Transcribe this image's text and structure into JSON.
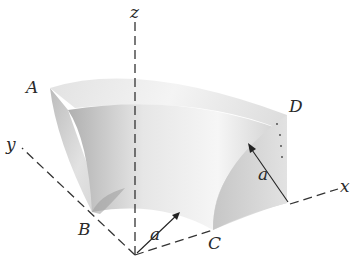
{
  "figure": {
    "type": "3d-solid-diagram",
    "axes": {
      "z_label": "z",
      "y_label": "y",
      "x_label": "x"
    },
    "points": {
      "A": "A",
      "B": "B",
      "C": "C",
      "D": "D"
    },
    "dimensions": {
      "inner_radius_label": "a",
      "outer_radius_label": "a"
    },
    "colors": {
      "background": "#ffffff",
      "line": "#333333",
      "shade_light": "#eeeeee",
      "shade_mid": "#d4d4d4",
      "shade_dark": "#a8a8a8"
    }
  }
}
